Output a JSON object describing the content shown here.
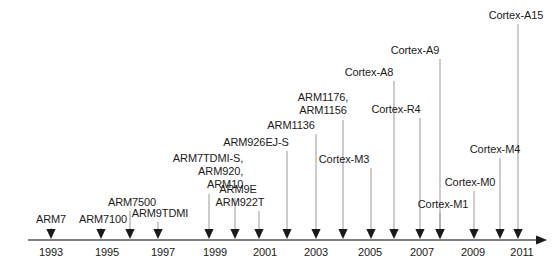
{
  "figure": {
    "type": "timeline",
    "width": 557,
    "height": 278,
    "background_color": "#ffffff",
    "text_color": "#1a1a1a",
    "axis_color": "#808080",
    "marker_color": "#1a1a1a",
    "leader_color": "#999999"
  },
  "axis": {
    "name": "year-axis",
    "orientation": "horizontal",
    "y": 240,
    "x_start": 28,
    "x_end": 536,
    "has_end_arrow": true,
    "range": [
      1992.3,
      2011.6
    ],
    "ticks": [
      {
        "label": "1993",
        "x": 51
      },
      {
        "label": "1995",
        "x": 107
      },
      {
        "label": "1997",
        "x": 163
      },
      {
        "label": "1999",
        "x": 215
      },
      {
        "label": "2001",
        "x": 265
      },
      {
        "label": "2003",
        "x": 316
      },
      {
        "label": "2005",
        "x": 370
      },
      {
        "label": "2007",
        "x": 422
      },
      {
        "label": "2009",
        "x": 473
      },
      {
        "label": "2011",
        "x": 522
      }
    ]
  },
  "chart_data": {
    "type": "timeline",
    "xlabel": "",
    "ylabel": "",
    "xlim": [
      1992.3,
      2011.6
    ],
    "grid": false,
    "legend": "none",
    "categories": [
      "ARM7",
      "ARM7100",
      "ARM7500",
      "ARM9TDMI",
      "ARM7TDMI-S, ARM920, ARM10",
      "ARM9E",
      "ARM922T",
      "ARM926EJ-S",
      "ARM1136",
      "ARM1176, ARM1156",
      "Cortex-M3",
      "Cortex-A8",
      "Cortex-R4",
      "Cortex-A9",
      "Cortex-M1",
      "Cortex-M0",
      "Cortex-M4",
      "Cortex-A15"
    ],
    "values": [
      1993,
      1995,
      1996,
      1997,
      1998,
      1999,
      2000,
      2001,
      2002,
      2003,
      2004,
      2005,
      2006,
      2007,
      2007,
      2009,
      2010,
      2011
    ]
  },
  "entries": [
    {
      "name": "arm7",
      "label": "ARM7",
      "marker_x": 51,
      "label_x": 51,
      "label_y": 213,
      "leader_top": 228,
      "leader_bottom": 232,
      "align": "center"
    },
    {
      "name": "arm7100",
      "label": "ARM7100",
      "marker_x": 101,
      "label_x": 103,
      "label_y": 213,
      "leader_top": 228,
      "leader_bottom": 232,
      "align": "center"
    },
    {
      "name": "arm7500",
      "label": "ARM7500",
      "marker_x": 130,
      "label_x": 132,
      "label_y": 196,
      "leader_top": 211,
      "leader_bottom": 232,
      "align": "center"
    },
    {
      "name": "arm9tdmi",
      "label": "ARM9TDMI",
      "marker_x": 158,
      "label_x": 160,
      "label_y": 207,
      "leader_top": 222,
      "leader_bottom": 232,
      "align": "center"
    },
    {
      "name": "arm7tdmi-s-arm920-arm10",
      "label": "ARM7TDMI-S,\nARM920,\nARM10",
      "marker_x": 209,
      "label_x": 208,
      "label_y": 152,
      "leader_top": 194,
      "leader_bottom": 232,
      "align": "right"
    },
    {
      "name": "arm9e",
      "label": "ARM9E",
      "marker_x": 235,
      "label_x": 238,
      "label_y": 183,
      "leader_top": 198,
      "leader_bottom": 232,
      "align": "center"
    },
    {
      "name": "arm922t",
      "label": "ARM922T",
      "marker_x": 259,
      "label_x": 240,
      "label_y": 196,
      "leader_top": 211,
      "leader_bottom": 232,
      "align": "center"
    },
    {
      "name": "arm926ej-s",
      "label": "ARM926EJ-S",
      "marker_x": 287,
      "label_x": 256,
      "label_y": 136,
      "leader_top": 151,
      "leader_bottom": 232,
      "align": "center"
    },
    {
      "name": "arm1136",
      "label": "ARM1136",
      "marker_x": 316,
      "label_x": 291,
      "label_y": 119,
      "leader_top": 134,
      "leader_bottom": 232,
      "align": "center"
    },
    {
      "name": "arm1176-arm1156",
      "label": "ARM1176,\nARM1156",
      "marker_x": 343,
      "label_x": 323,
      "label_y": 91,
      "leader_top": 120,
      "leader_bottom": 232,
      "align": "center"
    },
    {
      "name": "cortex-m3",
      "label": "Cortex-M3",
      "marker_x": 371,
      "label_x": 344,
      "label_y": 153,
      "leader_top": 168,
      "leader_bottom": 232,
      "align": "center"
    },
    {
      "name": "cortex-a8",
      "label": "Cortex-A8",
      "marker_x": 394,
      "label_x": 369,
      "label_y": 66,
      "leader_top": 81,
      "leader_bottom": 232,
      "align": "center"
    },
    {
      "name": "cortex-r4",
      "label": "Cortex-R4",
      "marker_x": 420,
      "label_x": 396,
      "label_y": 103,
      "leader_top": 118,
      "leader_bottom": 232,
      "align": "center"
    },
    {
      "name": "cortex-a9",
      "label": "Cortex-A9",
      "marker_x": 440,
      "label_x": 415,
      "label_y": 44,
      "leader_top": 59,
      "leader_bottom": 232,
      "align": "center"
    },
    {
      "name": "cortex-m1",
      "label": "Cortex-M1",
      "marker_x": 440,
      "label_x": 443,
      "label_y": 198,
      "leader_top": 213,
      "leader_bottom": 232,
      "align": "center"
    },
    {
      "name": "cortex-m0",
      "label": "Cortex-M0",
      "marker_x": 474,
      "label_x": 470,
      "label_y": 176,
      "leader_top": 191,
      "leader_bottom": 232,
      "align": "center"
    },
    {
      "name": "cortex-m4",
      "label": "Cortex-M4",
      "marker_x": 500,
      "label_x": 495,
      "label_y": 143,
      "leader_top": 158,
      "leader_bottom": 232,
      "align": "center"
    },
    {
      "name": "cortex-a15",
      "label": "Cortex-A15",
      "marker_x": 518,
      "label_x": 516,
      "label_y": 9,
      "leader_top": 24,
      "leader_bottom": 232,
      "align": "center"
    }
  ]
}
